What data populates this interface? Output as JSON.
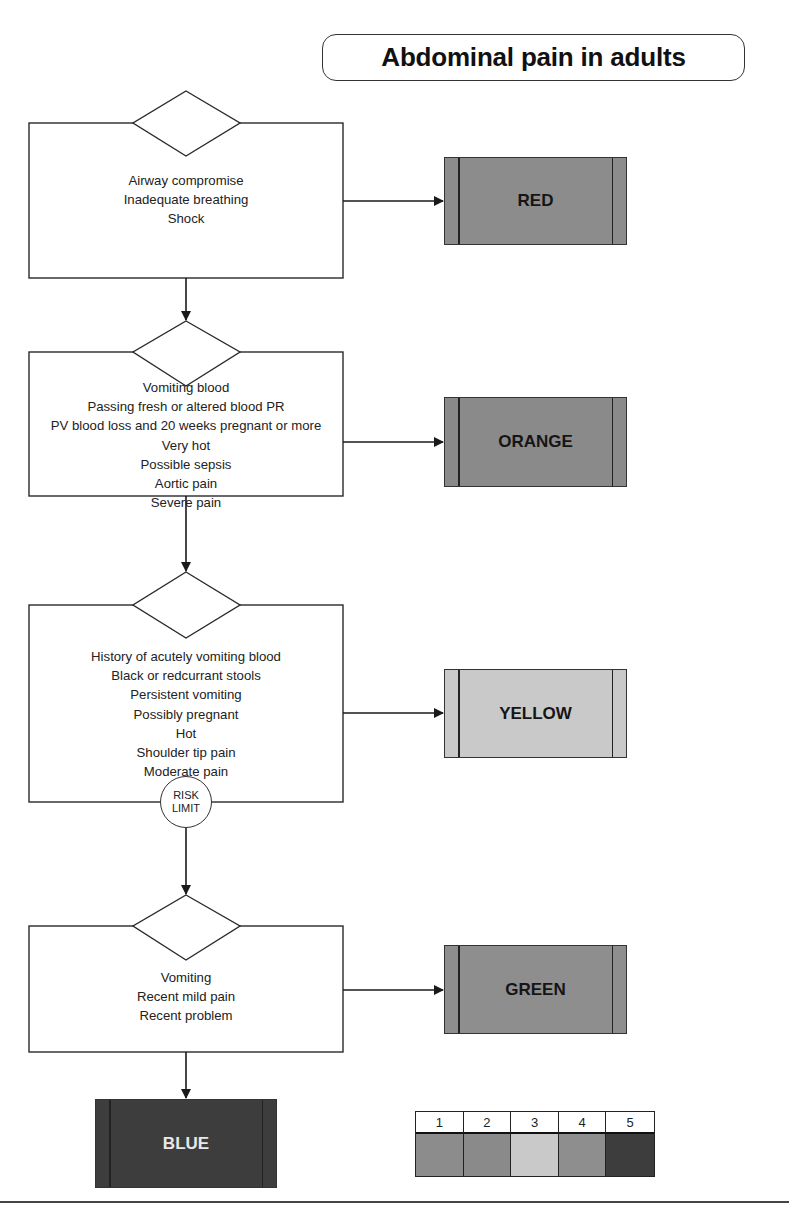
{
  "title": "Abdominal pain in adults",
  "colors": {
    "line": "#2a2a2a",
    "red": "#8c8c8c",
    "orange": "#8a8a8a",
    "yellow": "#c9c9c9",
    "green": "#8e8e8e",
    "blue": "#3d3d3d",
    "blue_text": "#e8e8e8"
  },
  "levels": [
    {
      "criteria": [
        "Airway compromise",
        "Inadequate breathing",
        "Shock"
      ],
      "outcome": "RED"
    },
    {
      "criteria": [
        "Vomiting blood",
        "Passing fresh or altered blood PR",
        "PV blood loss and 20 weeks pregnant or more",
        "Very hot",
        "Possible sepsis",
        "Aortic pain",
        "Severe pain"
      ],
      "outcome": "ORANGE"
    },
    {
      "criteria": [
        "History of acutely vomiting blood",
        "Black or redcurrant stools",
        "Persistent vomiting",
        "Possibly pregnant",
        "Hot",
        "Shoulder tip pain",
        "Moderate pain"
      ],
      "outcome": "YELLOW"
    },
    {
      "criteria": [
        "Vomiting",
        "Recent mild pain",
        "Recent problem"
      ],
      "outcome": "GREEN"
    }
  ],
  "risk_limit": {
    "line1": "RISK",
    "line2": "LIMIT"
  },
  "default_outcome": "BLUE",
  "legend": {
    "headers": [
      "1",
      "2",
      "3",
      "4",
      "5"
    ],
    "swatches": [
      "#8c8c8c",
      "#8a8a8a",
      "#c9c9c9",
      "#8e8e8e",
      "#3d3d3d"
    ]
  }
}
